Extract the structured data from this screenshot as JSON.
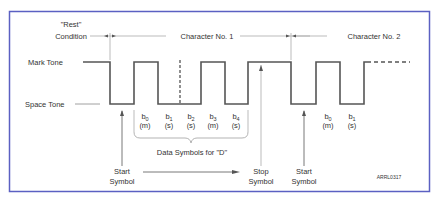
{
  "figure": {
    "frame_color": "#5b60c2",
    "line_color": "#555555",
    "thin_color": "#aaaaaa",
    "credit": "ARRL0317"
  },
  "labels": {
    "rest_line1": "\"Rest\"",
    "rest_line2": "Condition",
    "char1": "Character No. 1",
    "char2": "Character No. 2",
    "mark": "Mark Tone",
    "space": "Space Tone",
    "data_symbols": "Data Symbols for \"D\"",
    "start1_line1": "Start",
    "start1_line2": "Symbol",
    "stop_line1": "Stop",
    "stop_line2": "Symbol",
    "start2_line1": "Start",
    "start2_line2": "Symbol"
  },
  "bits": [
    {
      "name": "b",
      "sub": "0",
      "val": "(m)"
    },
    {
      "name": "b",
      "sub": "1",
      "val": "(s)"
    },
    {
      "name": "b",
      "sub": "2",
      "val": "(s)"
    },
    {
      "name": "b",
      "sub": "3",
      "val": "(m)"
    },
    {
      "name": "b",
      "sub": "4",
      "val": "(s)"
    }
  ],
  "bits2": [
    {
      "name": "b",
      "sub": "0",
      "val": "(m)"
    },
    {
      "name": "b",
      "sub": "1",
      "val": "(s)"
    }
  ]
}
